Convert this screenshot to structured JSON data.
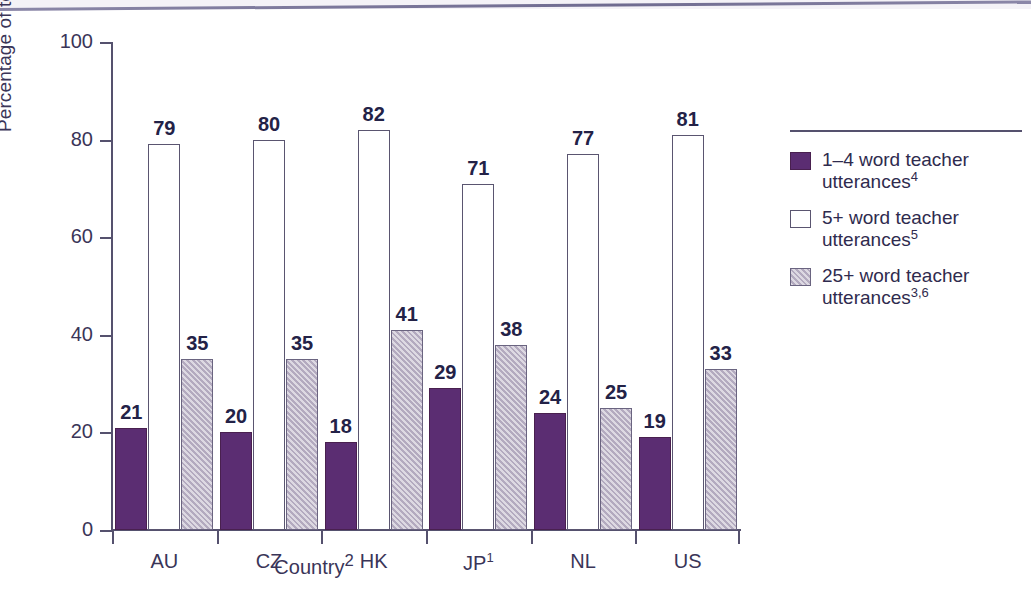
{
  "chart_data": {
    "type": "bar",
    "title": "",
    "xlabel": "Country",
    "xlabel_sup": "2",
    "ylabel": "Percentage of teacher utterances",
    "ylim": [
      0,
      100
    ],
    "yticks": [
      0,
      20,
      40,
      60,
      80,
      100
    ],
    "grid": false,
    "legend_position": "right",
    "categories": [
      "AU",
      "CZ",
      "HK",
      "JP",
      "NL",
      "US"
    ],
    "category_sups": [
      "",
      "",
      "",
      "1",
      "",
      ""
    ],
    "series": [
      {
        "name": "1–4 word teacher utterances",
        "name_sup": "4",
        "color": "#5b2d72",
        "style": "solid",
        "values": [
          21,
          20,
          18,
          29,
          24,
          19
        ]
      },
      {
        "name": "5+ word teacher utterances",
        "name_sup": "5",
        "color": "#ffffff",
        "style": "outline",
        "values": [
          79,
          80,
          82,
          71,
          77,
          81
        ]
      },
      {
        "name": "25+ word teacher utterances",
        "name_sup": "3,6",
        "color": "#b3aabf",
        "style": "hatched",
        "values": [
          35,
          35,
          41,
          38,
          25,
          33
        ]
      }
    ]
  },
  "axes": {
    "y_tick_labels": [
      "0",
      "20",
      "40",
      "60",
      "80",
      "100"
    ],
    "x_tick_labels": [
      "AU",
      "CZ",
      "HK",
      "JP",
      "NL",
      "US"
    ],
    "y_title": "Percentage of teacher utterances",
    "x_title": "Country",
    "x_title_sup": "2"
  },
  "legend": {
    "items": [
      {
        "label": "1–4 word teacher utterances",
        "sup": "4",
        "swatch": "solid-purple-swatch"
      },
      {
        "label": "5+ word teacher utterances",
        "sup": "5",
        "swatch": "white-outline-swatch"
      },
      {
        "label": "25+ word teacher utterances",
        "sup": "3,6",
        "swatch": "hatched-lavender-swatch"
      }
    ]
  },
  "colors": {
    "series_1": "#5b2d72",
    "series_2": "#ffffff",
    "series_3": "#b3aabf",
    "axis": "#55516e",
    "label_text": "#232247",
    "background": "#ffffff"
  }
}
